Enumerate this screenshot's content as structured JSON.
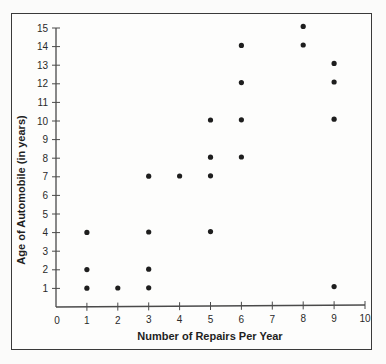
{
  "chart_data": {
    "type": "scatter",
    "title": "",
    "xlabel": "Number of Repairs Per Year",
    "ylabel": "Age of Automobile (in years)",
    "xlim": [
      0,
      10
    ],
    "ylim": [
      0,
      15
    ],
    "x_ticks": [
      0,
      1,
      2,
      3,
      4,
      5,
      6,
      7,
      8,
      9,
      10
    ],
    "y_ticks": [
      1,
      2,
      3,
      4,
      5,
      6,
      7,
      8,
      9,
      10,
      11,
      12,
      13,
      14,
      15
    ],
    "grid": false,
    "legend": null,
    "series": [
      {
        "name": "Automobiles",
        "color": "#1e1e1e",
        "points": [
          {
            "x": 1,
            "y": 1
          },
          {
            "x": 1,
            "y": 2
          },
          {
            "x": 1,
            "y": 4
          },
          {
            "x": 2,
            "y": 1
          },
          {
            "x": 3,
            "y": 1
          },
          {
            "x": 3,
            "y": 2
          },
          {
            "x": 3,
            "y": 4
          },
          {
            "x": 3,
            "y": 7
          },
          {
            "x": 4,
            "y": 7
          },
          {
            "x": 5,
            "y": 4
          },
          {
            "x": 5,
            "y": 7
          },
          {
            "x": 5,
            "y": 8
          },
          {
            "x": 5,
            "y": 10
          },
          {
            "x": 6,
            "y": 8
          },
          {
            "x": 6,
            "y": 10
          },
          {
            "x": 6,
            "y": 12
          },
          {
            "x": 6,
            "y": 14
          },
          {
            "x": 8,
            "y": 14
          },
          {
            "x": 8,
            "y": 15
          },
          {
            "x": 9,
            "y": 1
          },
          {
            "x": 9,
            "y": 10
          },
          {
            "x": 9,
            "y": 12
          },
          {
            "x": 9,
            "y": 13
          }
        ]
      }
    ]
  },
  "colors": {
    "axis": "#4a4a4a",
    "frame": "#3a3a3a",
    "dot": "#1e1e1e",
    "text": "#2a2a2a"
  }
}
